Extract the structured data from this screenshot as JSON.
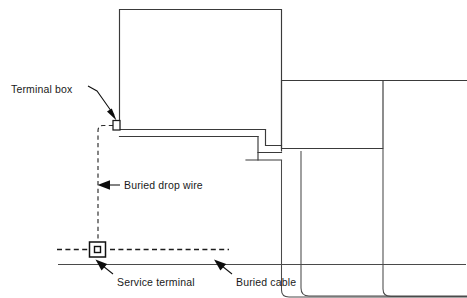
{
  "figure": {
    "background_color": "#ffffff",
    "line_color": "#3a3a3a",
    "text_color": "#1a1a1a",
    "width": 467,
    "height": 298
  },
  "labels": {
    "terminal_box": "Terminal box",
    "buried_drop_wire": "Buried drop wire",
    "service_terminal": "Service terminal",
    "buried_cable": "Buried cable"
  },
  "elements": {
    "main_building_name": "main-building-outline",
    "annex_building_name": "annex-building-outline",
    "step_name": "building-step-detail",
    "ground_line_name": "ground-line",
    "walkway_name": "walkway-lines",
    "terminal_box_symbol": "terminal-box-symbol",
    "service_terminal_symbol": "service-terminal-symbol",
    "drop_wire_path": "buried-drop-wire-path",
    "buried_cable_path": "buried-cable-path"
  }
}
